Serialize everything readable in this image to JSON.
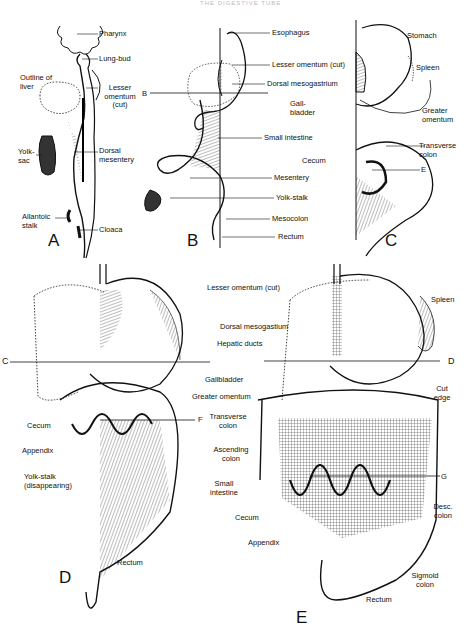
{
  "figure": {
    "header": "THE DIGESTIVE TUBE",
    "panels": [
      {
        "letter": "A",
        "labels": {
          "pharynx": "Pharynx",
          "lung_bud": "Lung-bud",
          "outline_of_liver": "Outline of liver",
          "lesser_omentum": "Lesser omentum (cut)",
          "yolk_sac": "Yolk-sac",
          "dorsal_mesentery": "Dorsal mesentery",
          "allantoic_stalk": "Allantoic stalk",
          "cloaca": "Cloaca"
        }
      },
      {
        "letter": "B",
        "section_mark": "B",
        "labels": {
          "esophagus": "Esophagus",
          "lesser_omentum": "Lesser omentum (cut)",
          "dorsal_mesogastrium": "Dorsal mesogastrium",
          "gall_bladder": "Gall-bladder",
          "small_intestine": "Small intestine",
          "cecum": "Cecum",
          "mesentery": "Mesentery",
          "yolk_stalk": "Yolk-stalk",
          "mesocolon": "Mesocolon",
          "rectum": "Rectum"
        }
      },
      {
        "letter": "C",
        "section_mark": "E",
        "labels": {
          "stomach": "Stomach",
          "spleen": "Spleen",
          "greater_omentum": "Greater omentum",
          "transverse_colon": "Transverse colon"
        }
      },
      {
        "letter": "D",
        "section_marks": [
          "C",
          "F"
        ],
        "labels": {
          "cecum": "Cecum",
          "appendix": "Appendix",
          "yolk_stalk": "Yolk-stalk (disappearing)",
          "rectum": "Rectum"
        }
      },
      {
        "letter": "E",
        "section_marks": [
          "D",
          "G"
        ],
        "labels": {
          "lesser_omentum": "Lesser omentum (cut)",
          "dorsal_mesogastium": "Dorsal mesogastium",
          "hepatic_ducts": "Hepatic ducts",
          "gallbladder": "Gallbladder",
          "greater_omentum": "Greater omentum",
          "transverse_colon": "Transverse colon",
          "ascending_colon": "Ascending colon",
          "small_intestine": "Small intestine",
          "cecum": "Cecum",
          "appendix": "Appendix",
          "spleen": "Spleen",
          "cut_edge": "Cut edge",
          "desc_colon": "Desc. colon",
          "sigmoid_colon": "Sigmoid colon",
          "rectum": "Rectum"
        }
      }
    ]
  }
}
